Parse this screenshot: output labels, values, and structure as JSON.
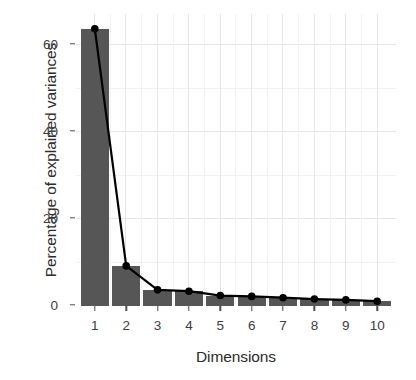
{
  "figure": {
    "name": "scree-plot",
    "background_color": "#ffffff",
    "bar_color": "#565656",
    "line_color": "#000000",
    "point_color": "#000000",
    "gridline_color": "#e6e6e8"
  },
  "axes": {
    "x_title": "Dimensions",
    "y_title": "Percentage of explained variances",
    "x_tick_labels": [
      "1",
      "2",
      "3",
      "4",
      "5",
      "6",
      "7",
      "8",
      "9",
      "10"
    ],
    "y_tick_labels": [
      "0",
      "20",
      "40",
      "60"
    ],
    "y_tick_values": [
      0,
      20,
      40,
      60
    ],
    "y_minor_tick_values": [
      10,
      30,
      50
    ],
    "y_range": [
      0,
      67
    ],
    "x_range": [
      0.4,
      10.6
    ]
  },
  "chart_data": {
    "type": "bar",
    "title": "",
    "subtitle": "",
    "xlabel": "Dimensions",
    "ylabel": "Percentage of explained variances",
    "categories": [
      "1",
      "2",
      "3",
      "4",
      "5",
      "6",
      "7",
      "8",
      "9",
      "10"
    ],
    "values": [
      63.6,
      9.2,
      3.7,
      3.4,
      2.4,
      2.2,
      1.9,
      1.6,
      1.4,
      1.1
    ],
    "overlay": {
      "type": "line",
      "name": "eigenvalue-trend",
      "marker": "filled-circle",
      "x": [
        1,
        2,
        3,
        4,
        5,
        6,
        7,
        8,
        9,
        10
      ],
      "y": [
        63.6,
        9.2,
        3.7,
        3.4,
        2.4,
        2.2,
        1.9,
        1.6,
        1.4,
        1.1
      ]
    },
    "ylim": [
      0,
      67
    ],
    "xlim": [
      0.4,
      10.6
    ],
    "grid": true,
    "legend": "none"
  }
}
